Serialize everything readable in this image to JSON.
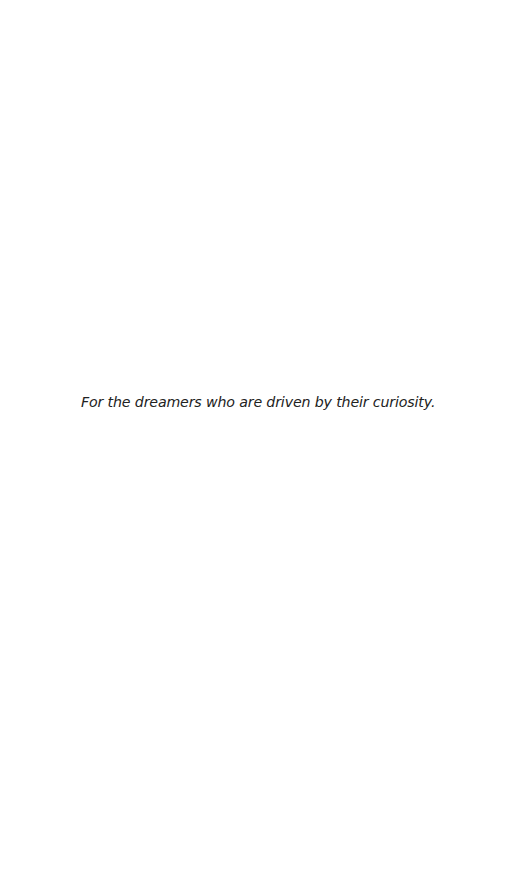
{
  "page": {
    "type": "dedication",
    "dedication_text": "For the dreamers who are driven by their curiosity.",
    "colors": {
      "background": "#ffffff",
      "text": "#222222"
    }
  }
}
